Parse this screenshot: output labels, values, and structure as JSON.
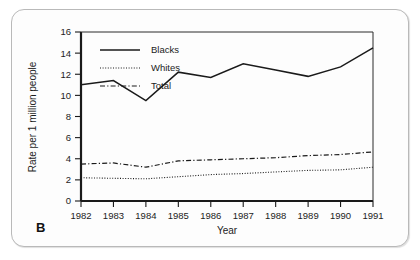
{
  "figure": {
    "panel_label": "B"
  },
  "chart_data": {
    "type": "line",
    "title": "",
    "xlabel": "Year",
    "ylabel": "Rate per 1 million people",
    "categories": [
      "1982",
      "1983",
      "1984",
      "1985",
      "1986",
      "1987",
      "1988",
      "1989",
      "1990",
      "1991"
    ],
    "x": [
      1982,
      1983,
      1984,
      1985,
      1986,
      1987,
      1988,
      1989,
      1990,
      1991
    ],
    "xlim": [
      1982,
      1991
    ],
    "ylim": [
      0,
      16
    ],
    "yticks": [
      0,
      2,
      4,
      6,
      8,
      10,
      12,
      14,
      16
    ],
    "ytick_labels": [
      "0",
      "2",
      "4",
      "6",
      "8",
      "10",
      "12",
      "14",
      "16"
    ],
    "grid": false,
    "legend_position": "top-left",
    "series": [
      {
        "name": "Blacks",
        "style": "solid",
        "values": [
          11.0,
          11.4,
          9.5,
          12.2,
          11.7,
          13.0,
          12.4,
          11.8,
          12.7,
          14.5
        ]
      },
      {
        "name": "Whites",
        "style": "dotted",
        "values": [
          2.2,
          2.15,
          2.1,
          2.3,
          2.5,
          2.6,
          2.75,
          2.9,
          2.95,
          3.2
        ]
      },
      {
        "name": "Total",
        "style": "dash-dot",
        "values": [
          3.5,
          3.6,
          3.2,
          3.8,
          3.9,
          4.0,
          4.1,
          4.3,
          4.4,
          4.65
        ]
      }
    ]
  },
  "colors": {
    "ink": "#1a1a1a",
    "card_background": "#fdfdfd",
    "card_border": "#b9b9b9"
  }
}
